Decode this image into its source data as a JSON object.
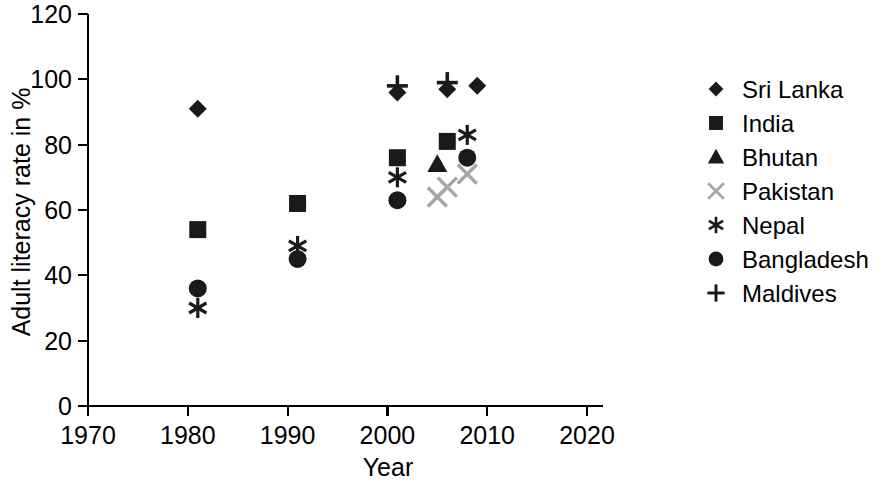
{
  "chart_data": {
    "type": "scatter",
    "title": "",
    "xlabel": "Year",
    "ylabel": "Adult literacy rate in %",
    "xlim": [
      1970,
      2020
    ],
    "ylim": [
      0,
      120
    ],
    "xticks": [
      "1970",
      "1980",
      "1990",
      "2000",
      "2010",
      "2020"
    ],
    "yticks": [
      "0",
      "20",
      "40",
      "60",
      "80",
      "100",
      "120"
    ],
    "grid": false,
    "legend_position": "right",
    "series": [
      {
        "name": "Sri Lanka",
        "marker": "diamond",
        "color": "#1a1a1a",
        "points": [
          {
            "x": 1981,
            "y": 91
          },
          {
            "x": 2001,
            "y": 96
          },
          {
            "x": 2006,
            "y": 97
          },
          {
            "x": 2009,
            "y": 98
          }
        ]
      },
      {
        "name": "India",
        "marker": "square",
        "color": "#1a1a1a",
        "points": [
          {
            "x": 1981,
            "y": 54
          },
          {
            "x": 1991,
            "y": 62
          },
          {
            "x": 2001,
            "y": 76
          },
          {
            "x": 2006,
            "y": 81
          }
        ]
      },
      {
        "name": "Bhutan",
        "marker": "triangle",
        "color": "#1a1a1a",
        "points": [
          {
            "x": 2005,
            "y": 74
          }
        ]
      },
      {
        "name": "Pakistan",
        "marker": "cross-x",
        "color": "#a6a6a6",
        "points": [
          {
            "x": 2005,
            "y": 64
          },
          {
            "x": 2006,
            "y": 67
          },
          {
            "x": 2008,
            "y": 71
          }
        ]
      },
      {
        "name": "Nepal",
        "marker": "asterisk",
        "color": "#1a1a1a",
        "points": [
          {
            "x": 1981,
            "y": 30
          },
          {
            "x": 1991,
            "y": 49
          },
          {
            "x": 2001,
            "y": 70
          },
          {
            "x": 2008,
            "y": 83
          }
        ]
      },
      {
        "name": "Bangladesh",
        "marker": "circle",
        "color": "#1a1a1a",
        "points": [
          {
            "x": 1981,
            "y": 36
          },
          {
            "x": 1991,
            "y": 45
          },
          {
            "x": 2001,
            "y": 63
          },
          {
            "x": 2008,
            "y": 76
          }
        ]
      },
      {
        "name": "Maldives",
        "marker": "plus",
        "color": "#1a1a1a",
        "points": [
          {
            "x": 2001,
            "y": 98
          },
          {
            "x": 2006,
            "y": 99
          }
        ]
      }
    ]
  },
  "legend": {
    "items": [
      {
        "label": "Sri Lanka",
        "marker": "diamond",
        "color": "#1a1a1a"
      },
      {
        "label": "India",
        "marker": "square",
        "color": "#1a1a1a"
      },
      {
        "label": "Bhutan",
        "marker": "triangle",
        "color": "#1a1a1a"
      },
      {
        "label": "Pakistan",
        "marker": "cross-x",
        "color": "#a6a6a6"
      },
      {
        "label": "Nepal",
        "marker": "asterisk",
        "color": "#1a1a1a"
      },
      {
        "label": "Bangladesh",
        "marker": "circle",
        "color": "#1a1a1a"
      },
      {
        "label": "Maldives",
        "marker": "plus",
        "color": "#1a1a1a"
      }
    ]
  }
}
